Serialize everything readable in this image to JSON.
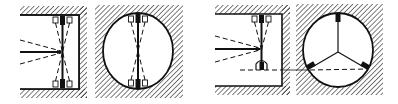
{
  "diagram": {
    "colors": {
      "ink": "#111111",
      "background": "#ffffff"
    },
    "panels": [
      {
        "id": "panel-1",
        "view": "side-section",
        "mount": "two opposed sensor pairs (top and bottom), beams converging to center",
        "labels": []
      },
      {
        "id": "panel-2",
        "view": "end-section-circular",
        "mount": "two opposed diametral sensor pairs",
        "labels": []
      },
      {
        "id": "panel-3",
        "view": "side-section",
        "mount": "top sensor pair and one lower sensor, with horizontal dashed reference line",
        "labels": []
      },
      {
        "id": "panel-4",
        "view": "end-section-circular",
        "mount": "three radial sensors at 120 degrees, dashed chord between lower two",
        "labels": []
      }
    ],
    "icons": [
      "hatch-pattern",
      "sensor-block",
      "dashed-beam"
    ]
  }
}
